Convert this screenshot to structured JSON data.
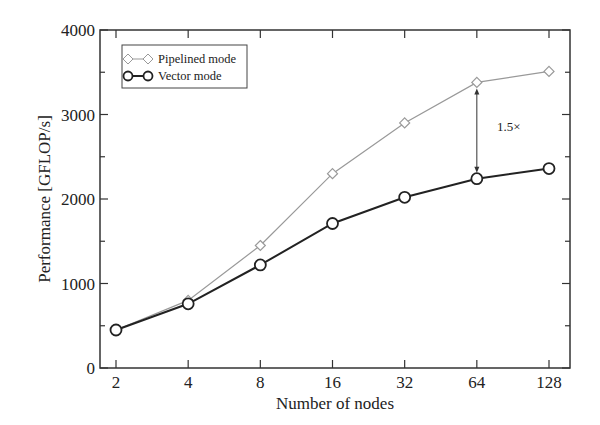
{
  "chart_data": {
    "type": "line",
    "title": "",
    "xlabel": "Number of nodes",
    "ylabel": "Performance [GFLOP/s]",
    "x_scale": "log2",
    "categories": [
      "2",
      "4",
      "8",
      "16",
      "32",
      "64",
      "128"
    ],
    "x": [
      2,
      4,
      8,
      16,
      32,
      64,
      128
    ],
    "ylim": [
      0,
      4000
    ],
    "yticks": [
      0,
      1000,
      2000,
      3000,
      4000
    ],
    "ytick_labels": [
      "0",
      "1000",
      "2000",
      "3000",
      "4000"
    ],
    "minor_ytick_step": 500,
    "grid": false,
    "legend_position": "upper left",
    "series": [
      {
        "name": "Pipelined mode",
        "marker": "diamond-open",
        "color": "#999999",
        "values": [
          450,
          800,
          1450,
          2300,
          2900,
          3380,
          3510
        ]
      },
      {
        "name": "Vector mode",
        "marker": "circle-open",
        "color": "#222222",
        "values": [
          450,
          760,
          1220,
          1710,
          2020,
          2240,
          2360
        ]
      }
    ],
    "annotations": [
      {
        "text": "1.5×",
        "type": "double-arrow",
        "x": 64,
        "y_from": 2240,
        "y_to": 3380
      }
    ]
  }
}
